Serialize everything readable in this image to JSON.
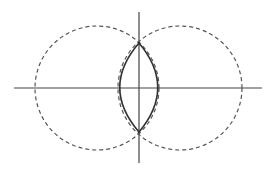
{
  "diagram": {
    "colors": {
      "background": "#ffffff",
      "axis": "#444444",
      "dashed_circle": "#555555",
      "lens": "#333333"
    },
    "axes": {
      "horizontal": {
        "x1": 14,
        "y1": 88,
        "x2": 262,
        "y2": 88
      },
      "vertical": {
        "x1": 139,
        "y1": 12,
        "x2": 139,
        "y2": 163
      }
    },
    "circles": [
      {
        "name": "left",
        "cx": 97,
        "cy": 88,
        "r": 62,
        "style": "dashed"
      },
      {
        "name": "right",
        "cx": 180,
        "cy": 88,
        "r": 62,
        "style": "dashed"
      }
    ],
    "lens": {
      "top": {
        "x": 139,
        "y": 43
      },
      "bottom": {
        "x": 139,
        "y": 132
      },
      "left_x": 119,
      "right_x": 158
    }
  }
}
